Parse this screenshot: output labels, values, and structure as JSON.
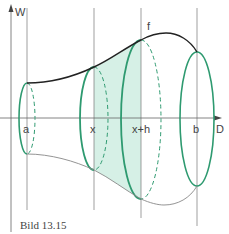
{
  "figure": {
    "caption": "Bild 13.15",
    "axes": {
      "vertical_label": "W",
      "horizontal_label": "D"
    },
    "curve_label": "f",
    "tick_labels": [
      "a",
      "x",
      "x+h",
      "b"
    ],
    "colors": {
      "axis": "#666666",
      "guide": "#777777",
      "curve_top": "#222222",
      "curve_bottom": "#888888",
      "ellipse": "#2e9a70",
      "fill": "#d6f0e6",
      "text": "#444444",
      "background": "#ffffff"
    }
  }
}
